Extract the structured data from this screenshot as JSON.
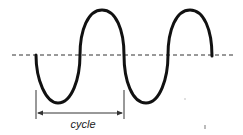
{
  "diagram": {
    "cycle_label": "cycle",
    "colors": {
      "wave": "#111111",
      "axis": "#333333",
      "background": "#ffffff"
    }
  }
}
